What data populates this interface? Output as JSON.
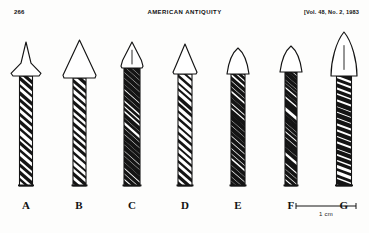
{
  "running_head": {
    "folio": "266",
    "journal": "AMERICAN ANTIQUITY",
    "volume_note": "[Vol. 48, No. 2, 1983"
  },
  "figure": {
    "scale_bar": {
      "label": "1 cm",
      "length_px": 62
    },
    "specimens": [
      {
        "label": "A",
        "point_style": "barbed-narrow",
        "point_width": 30,
        "point_height": 34,
        "shaft_width": 13,
        "shaft_height": 110,
        "center_x": 26,
        "has_midline": false,
        "hatch": "diagonal-open"
      },
      {
        "label": "B",
        "point_style": "broad-triangular",
        "point_width": 33,
        "point_height": 38,
        "shaft_width": 13,
        "shaft_height": 108,
        "center_x": 79,
        "has_midline": false,
        "hatch": "diagonal-open"
      },
      {
        "label": "C",
        "point_style": "small-shouldered",
        "point_width": 22,
        "point_height": 26,
        "shaft_width": 16,
        "shaft_height": 118,
        "center_x": 132,
        "has_midline": true,
        "hatch": "diagonal-dense"
      },
      {
        "label": "D",
        "point_style": "triangular-shouldered",
        "point_width": 24,
        "point_height": 30,
        "shaft_width": 14,
        "shaft_height": 112,
        "center_x": 185,
        "has_midline": false,
        "hatch": "diagonal-open"
      },
      {
        "label": "E",
        "point_style": "bullet-rounded",
        "point_width": 22,
        "point_height": 26,
        "shaft_width": 14,
        "shaft_height": 112,
        "center_x": 238,
        "has_midline": false,
        "hatch": "diagonal-dense"
      },
      {
        "label": "F",
        "point_style": "bullet-rounded",
        "point_width": 22,
        "point_height": 26,
        "shaft_width": 12,
        "shaft_height": 114,
        "center_x": 291,
        "has_midline": false,
        "hatch": "irregular-dense"
      },
      {
        "label": "G",
        "point_style": "leaf-tall",
        "point_width": 26,
        "point_height": 44,
        "shaft_width": 15,
        "shaft_height": 110,
        "center_x": 344,
        "has_midline": true,
        "hatch": "banded-dense"
      }
    ]
  },
  "colors": {
    "ink": "#141414",
    "paper": "#fdfdfc"
  }
}
